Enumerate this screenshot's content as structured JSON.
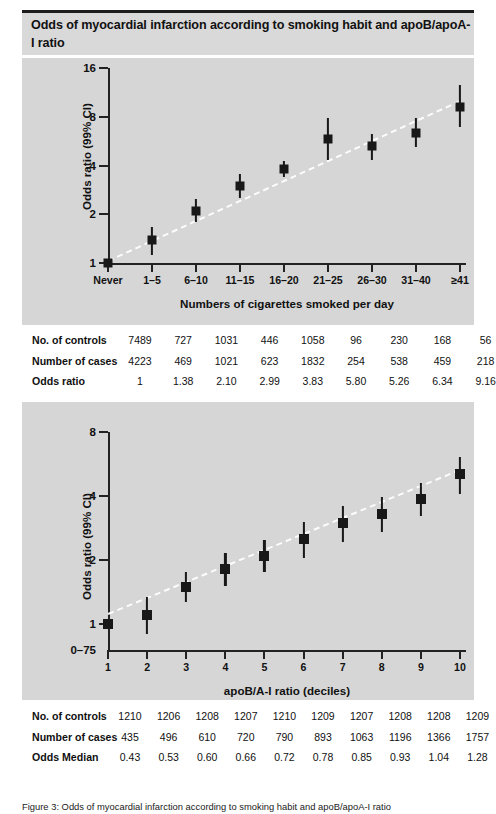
{
  "header": {
    "title": "Odds of myocardial infarction according to smoking habit and apoB/apoA-I ratio"
  },
  "caption": {
    "text": "Figure 3: Odds of myocardial infarction according to smoking habit and apoB/apoA-I ratio"
  },
  "colors": {
    "panel_background": "#d6d6d6",
    "header_band": "#d9d9d9",
    "marker": "#181818",
    "trend_line": "#ffffff",
    "axis": "#222222",
    "table_background": "#ffffff"
  },
  "chart_data": [
    {
      "id": "smoking",
      "type": "scatter",
      "title": "",
      "xlabel": "Numbers of cigarettes smoked per day",
      "ylabel": "Odds ratio (99% CI)",
      "yscale": "log",
      "yticks": [
        1,
        2,
        4,
        8,
        16
      ],
      "ytick_labels": [
        "1",
        "2",
        "4",
        "8",
        "16"
      ],
      "ylim": [
        1,
        16
      ],
      "grid": false,
      "legend": "none",
      "categories": [
        "Never",
        "1–5",
        "6–10",
        "11–15",
        "16–20",
        "21–25",
        "26–30",
        "31–40",
        "≥41"
      ],
      "values": [
        1.0,
        1.38,
        2.1,
        2.99,
        3.83,
        5.8,
        5.26,
        6.34,
        9.16
      ],
      "ci_low": [
        1.0,
        1.12,
        1.78,
        2.52,
        3.42,
        4.3,
        4.35,
        5.2,
        6.9
      ],
      "ci_high": [
        1.0,
        1.66,
        2.47,
        3.52,
        4.24,
        7.9,
        6.3,
        7.85,
        12.5
      ],
      "trend": {
        "from": 1.05,
        "to": 10.2,
        "style": "dashed",
        "color": "#ffffff"
      }
    },
    {
      "id": "apob",
      "type": "scatter",
      "title": "",
      "xlabel": "apoB/A-I ratio (deciles)",
      "ylabel": "Odds ratio (99% CI)",
      "yscale": "log",
      "yticks": [
        1,
        2,
        4,
        8
      ],
      "ytick_labels": [
        "1",
        "2",
        "4",
        "8"
      ],
      "ylim": [
        0.75,
        8
      ],
      "baseline_label": "0–75",
      "grid": false,
      "legend": "none",
      "categories": [
        "1",
        "2",
        "3",
        "4",
        "5",
        "6",
        "7",
        "8",
        "9",
        "10"
      ],
      "values": [
        1.0,
        1.1,
        1.49,
        1.8,
        2.09,
        2.5,
        2.99,
        3.3,
        3.88,
        5.05
      ],
      "ci_low": [
        1.0,
        0.89,
        1.26,
        1.5,
        1.74,
        2.03,
        2.43,
        2.7,
        3.2,
        4.1
      ],
      "ci_high": [
        1.0,
        1.34,
        1.74,
        2.16,
        2.48,
        3.0,
        3.58,
        3.96,
        4.6,
        6.1
      ],
      "trend": {
        "from": 1.12,
        "to": 5.35,
        "style": "dashed",
        "color": "#ffffff"
      }
    }
  ],
  "table_top": {
    "rows": [
      {
        "label": "No. of controls",
        "values": [
          "7489",
          "727",
          "1031",
          "446",
          "1058",
          "96",
          "230",
          "168",
          "56"
        ]
      },
      {
        "label": "Number of cases",
        "values": [
          "4223",
          "469",
          "1021",
          "623",
          "1832",
          "254",
          "538",
          "459",
          "218"
        ]
      },
      {
        "label": "Odds ratio",
        "values": [
          "1",
          "1.38",
          "2.10",
          "2.99",
          "3.83",
          "5.80",
          "5.26",
          "6.34",
          "9.16"
        ]
      }
    ]
  },
  "table_bottom": {
    "rows": [
      {
        "label": "No. of controls",
        "values": [
          "1210",
          "1206",
          "1208",
          "1207",
          "1210",
          "1209",
          "1207",
          "1208",
          "1208",
          "1209"
        ]
      },
      {
        "label": "Number of cases",
        "values": [
          "435",
          "496",
          "610",
          "720",
          "790",
          "893",
          "1063",
          "1196",
          "1366",
          "1757"
        ]
      },
      {
        "label": "Odds Median",
        "values": [
          "0.43",
          "0.53",
          "0.60",
          "0.66",
          "0.72",
          "0.78",
          "0.85",
          "0.93",
          "1.04",
          "1.28"
        ]
      }
    ]
  }
}
